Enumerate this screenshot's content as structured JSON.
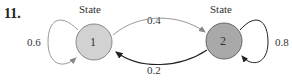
{
  "problem_number": "11.",
  "states": [
    {
      "id": "1",
      "label": "State",
      "fill": "#d2d2d2",
      "self_loop": "0.6"
    },
    {
      "id": "2",
      "label": "State",
      "fill": "#a9a9a9",
      "self_loop": "0.8"
    }
  ],
  "transitions": {
    "1_to_2": "0.4",
    "2_to_1": "0.2"
  }
}
